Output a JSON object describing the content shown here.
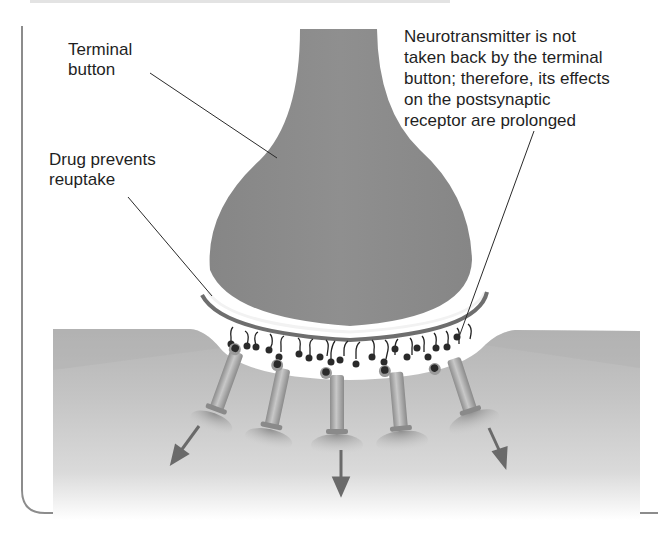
{
  "figure": {
    "colors": {
      "terminal": "#8a8a8a",
      "tissue": "#bdbdbd",
      "tissue_light": "#d6d6d6",
      "membrane_dark": "#6e6e6e",
      "vesicle": "#2a2a2a",
      "arrow": "#6a6a6a",
      "border": "#8c8c8c",
      "text": "#1f1f1f"
    },
    "labels": {
      "terminal_button": "Terminal\nbutton",
      "drug_prevents_reuptake": "Drug prevents\nreuptake",
      "neurotransmitter_note": "Neurotransmitter is not\ntaken back by the terminal\nbutton; therefore, its effects\non the postsynaptic\nreceptor are prolonged"
    },
    "structures": {
      "receptor_count": 5,
      "arrow_count": 3
    }
  }
}
